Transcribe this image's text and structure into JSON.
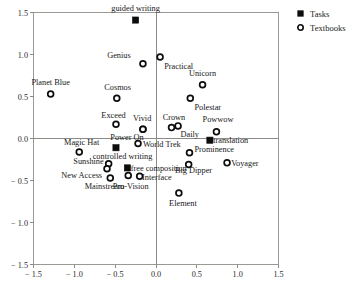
{
  "chart_data": {
    "type": "scatter",
    "title": "",
    "xlabel": "",
    "ylabel": "",
    "xlim": [
      -1.5,
      1.5
    ],
    "ylim": [
      -1.5,
      1.5
    ],
    "grid": false,
    "axis_lines_at_zero": true,
    "xticks": [
      -1.5,
      -1.0,
      -0.5,
      0.0,
      0.5,
      1.0,
      1.5
    ],
    "yticks": [
      1.5,
      1.0,
      0.5,
      0.0,
      -0.5,
      -1.0,
      -1.5
    ],
    "xticklabels": [
      "− 1.5",
      "− 1.0",
      "− 0.5",
      "0.0",
      "0.5",
      "1.0",
      "1.5"
    ],
    "yticklabels": [
      "1.5",
      "1.0",
      "0.5",
      "0.0",
      "− 0.5",
      "− 1.0",
      "− 1.5"
    ],
    "legend": {
      "position": "upper-right-outside",
      "entries": [
        {
          "name": "Tasks",
          "marker": "filled-square",
          "color": "#0d0d0d"
        },
        {
          "name": "Textbooks",
          "marker": "open-circle",
          "color": "#0d0d0d"
        }
      ]
    },
    "series": [
      {
        "name": "Tasks",
        "marker": "filled-square",
        "points": [
          {
            "label": "guided writing",
            "x": -0.25,
            "y": 1.41,
            "lx": -0.25,
            "ly": 1.55,
            "anchor": "middle"
          },
          {
            "label": "controlled writing",
            "x": -0.49,
            "y": -0.11,
            "lx": -0.41,
            "ly": -0.21,
            "anchor": "middle"
          },
          {
            "label": "free composition",
            "x": -0.35,
            "y": -0.35,
            "lx": -0.31,
            "ly": -0.35,
            "anchor": "start"
          },
          {
            "label": "translation",
            "x": 0.66,
            "y": -0.02,
            "lx": 0.7,
            "ly": -0.02,
            "anchor": "start"
          }
        ]
      },
      {
        "name": "Textbooks",
        "marker": "open-circle",
        "points": [
          {
            "label": "Genius",
            "x": -0.16,
            "y": 0.89,
            "lx": -0.31,
            "ly": 0.99,
            "anchor": "end"
          },
          {
            "label": "Practical",
            "x": 0.05,
            "y": 0.97,
            "lx": 0.1,
            "ly": 0.86,
            "anchor": "start"
          },
          {
            "label": "Unicorn",
            "x": 0.57,
            "y": 0.64,
            "lx": 0.57,
            "ly": 0.78,
            "anchor": "middle"
          },
          {
            "label": "Planet Blue",
            "x": -1.29,
            "y": 0.53,
            "lx": -1.29,
            "ly": 0.67,
            "anchor": "middle"
          },
          {
            "label": "Cosmos",
            "x": -0.48,
            "y": 0.48,
            "lx": -0.47,
            "ly": 0.61,
            "anchor": "middle"
          },
          {
            "label": "Polestar",
            "x": 0.42,
            "y": 0.48,
            "lx": 0.47,
            "ly": 0.37,
            "anchor": "start"
          },
          {
            "label": "Exceed",
            "x": -0.49,
            "y": 0.17,
            "lx": -0.52,
            "ly": 0.28,
            "anchor": "middle"
          },
          {
            "label": "Vivid",
            "x": -0.16,
            "y": 0.11,
            "lx": -0.17,
            "ly": 0.25,
            "anchor": "middle"
          },
          {
            "label": "Crown",
            "x": 0.27,
            "y": 0.15,
            "lx": 0.22,
            "ly": 0.26,
            "anchor": "middle"
          },
          {
            "label": "Daily",
            "x": 0.19,
            "y": 0.13,
            "lx": 0.3,
            "ly": 0.05,
            "anchor": "start"
          },
          {
            "label": "Powwow",
            "x": 0.74,
            "y": 0.08,
            "lx": 0.76,
            "ly": 0.23,
            "anchor": "middle"
          },
          {
            "label": "Power On",
            "x": -0.16,
            "y": 0.11,
            "lx": -0.15,
            "ly": 0.02,
            "anchor": "end"
          },
          {
            "label": "World Trek",
            "x": -0.22,
            "y": -0.06,
            "lx": -0.16,
            "ly": -0.07,
            "anchor": "start"
          },
          {
            "label": "Magic Hat",
            "x": -0.94,
            "y": -0.16,
            "lx": -0.91,
            "ly": -0.04,
            "anchor": "middle"
          },
          {
            "label": "Prominence",
            "x": 0.41,
            "y": -0.17,
            "lx": 0.47,
            "ly": -0.12,
            "anchor": "start"
          },
          {
            "label": "Sunshine",
            "x": -0.58,
            "y": -0.3,
            "lx": -0.64,
            "ly": -0.27,
            "anchor": "end"
          },
          {
            "label": "Voyager",
            "x": 0.87,
            "y": -0.29,
            "lx": 0.92,
            "ly": -0.29,
            "anchor": "start"
          },
          {
            "label": "Big Dipper",
            "x": 0.4,
            "y": -0.31,
            "lx": 0.46,
            "ly": -0.38,
            "anchor": "middle"
          },
          {
            "label": "New Access",
            "x": -0.6,
            "y": -0.36,
            "lx": -0.66,
            "ly": -0.44,
            "anchor": "end"
          },
          {
            "label": "Mainstream",
            "x": -0.56,
            "y": -0.47,
            "lx": -0.63,
            "ly": -0.56,
            "anchor": "middle"
          },
          {
            "label": "Interface",
            "x": -0.2,
            "y": -0.45,
            "lx": -0.17,
            "ly": -0.46,
            "anchor": "start"
          },
          {
            "label": "Pro-Vision",
            "x": -0.34,
            "y": -0.44,
            "lx": -0.31,
            "ly": -0.56,
            "anchor": "middle"
          },
          {
            "label": "Element",
            "x": 0.28,
            "y": -0.65,
            "lx": 0.33,
            "ly": -0.77,
            "anchor": "middle"
          }
        ]
      }
    ]
  }
}
